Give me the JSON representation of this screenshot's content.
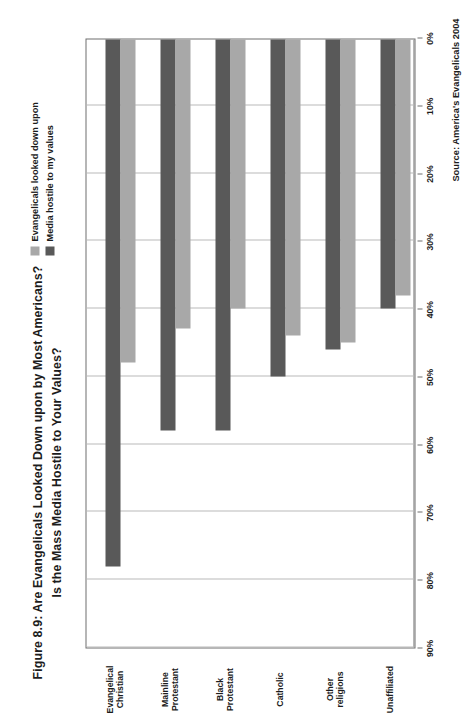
{
  "figure": {
    "title_line1": "Figure 8.9: Are Evangelicals Looked Down upon by Most Americans?",
    "title_line2": "Is the Mass Media Hostile to Your Values?",
    "source": "Source: America's Evangelicals 2004"
  },
  "legend": {
    "position": "top-right",
    "items": [
      {
        "label": "Evangelicals looked down upon",
        "color": "#a8a8a8",
        "swatch_name": "legend-swatch-light"
      },
      {
        "label": "Media hostile to my values",
        "color": "#595959",
        "swatch_name": "legend-swatch-dark"
      }
    ]
  },
  "colors": {
    "series_light": "#a8a8a8",
    "series_dark": "#595959",
    "gridline": "#b9b9b9",
    "axis": "#6e6e6e",
    "text": "#1c1c1c",
    "background": "#ffffff"
  },
  "chart_data": {
    "type": "bar",
    "orientation": "horizontal",
    "title": "Figure 8.9: Are Evangelicals Looked Down upon by Most Americans? Is the Mass Media Hostile to Your Values?",
    "xlabel": "",
    "ylabel": "",
    "xlim": [
      0,
      90
    ],
    "xticks": [
      0,
      10,
      20,
      30,
      40,
      50,
      60,
      70,
      80,
      90
    ],
    "xtick_labels": [
      "0%",
      "10%",
      "20%",
      "30%",
      "40%",
      "50%",
      "60%",
      "70%",
      "80%",
      "90%"
    ],
    "grid": true,
    "legend_position": "top-right",
    "categories": [
      "Evangelical Christian",
      "Mainline Protestant",
      "Black Protestant",
      "Catholic",
      "Other religions",
      "Unaffiliated"
    ],
    "series": [
      {
        "name": "Evangelicals looked down upon",
        "color": "#a8a8a8",
        "values": [
          48,
          43,
          40,
          44,
          45,
          38
        ]
      },
      {
        "name": "Media hostile to my values",
        "color": "#595959",
        "values": [
          78,
          58,
          58,
          50,
          46,
          40
        ]
      }
    ],
    "source": "Source: America's Evangelicals 2004"
  }
}
